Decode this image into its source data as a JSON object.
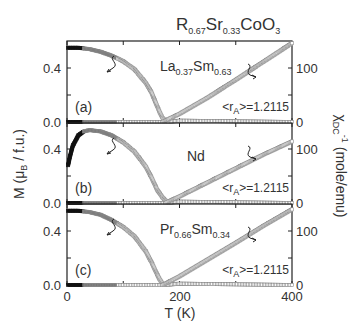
{
  "figure": {
    "title": {
      "main": "R",
      "sub1": "0.67",
      "mid": "Sr",
      "sub2": "0.33",
      "end": "CoO",
      "sub3": "3"
    },
    "x_axis": {
      "label": "T (K)",
      "ticks": [
        "0",
        "200",
        "400"
      ]
    },
    "left_axis": {
      "label": "M (μ",
      "label_sub": "B",
      "label_end": " / f.u.)",
      "ticks": [
        "0.0",
        "0.4"
      ]
    },
    "right_axis": {
      "label": "χ",
      "label_sub": "DC",
      "label_sup": "-1",
      "label_end": " (mole/emu)",
      "ticks": [
        "0",
        "100"
      ]
    },
    "panels": [
      {
        "tag": "(a)",
        "compound": {
          "a": "La",
          "a_sub": "0.37",
          "b": "Sm",
          "b_sub": "0.63"
        },
        "ra_text": "<r",
        "ra_sub": "A",
        "ra_end": ">=1.2115"
      },
      {
        "tag": "(b)",
        "compound": {
          "a": "Nd",
          "a_sub": "",
          "b": "",
          "b_sub": ""
        },
        "ra_text": "<r",
        "ra_sub": "A",
        "ra_end": ">=1.2115"
      },
      {
        "tag": "(c)",
        "compound": {
          "a": "Pr",
          "a_sub": "0.66",
          "b": "Sm",
          "b_sub": "0.34"
        },
        "ra_text": "<r",
        "ra_sub": "A",
        "ra_end": ">=1.2115"
      }
    ]
  },
  "chart_data": {
    "type": "scatter",
    "title": "R0.67Sr0.33CoO3",
    "xlabel": "T (K)",
    "ylabel": "M (μB / f.u.)",
    "ylabel_right": "χDC^-1 (mole/emu)",
    "xlim": [
      0,
      400
    ],
    "ylim": [
      0.0,
      0.6
    ],
    "ylim_right": [
      0,
      150
    ],
    "x_ticks": [
      0,
      200,
      400
    ],
    "y_ticks": [
      0.0,
      0.4
    ],
    "y_right_ticks": [
      0,
      100
    ],
    "panels": [
      {
        "label": "(a)",
        "compound": "La0.37Sm0.63",
        "annotation": "<rA>=1.2115",
        "series": [
          {
            "name": "M (left axis)",
            "x": [
              2,
              20,
              40,
              60,
              80,
              100,
              120,
              140,
              150,
              160,
              165,
              170,
              175,
              180
            ],
            "y": [
              0.55,
              0.55,
              0.54,
              0.52,
              0.49,
              0.45,
              0.39,
              0.29,
              0.22,
              0.12,
              0.07,
              0.03,
              0.01,
              0.0
            ]
          },
          {
            "name": "M baseline (left axis)",
            "x": [
              2,
              100,
              180,
              200,
              300,
              400
            ],
            "y": [
              0.0,
              0.0,
              0.0,
              0.01,
              0.005,
              0.0
            ]
          },
          {
            "name": "inverse chi (right axis)",
            "x": [
              170,
              180,
              200,
              250,
              300,
              350,
              400
            ],
            "y": [
              0,
              5,
              15,
              45,
              78,
              112,
              146
            ]
          }
        ]
      },
      {
        "label": "(b)",
        "compound": "Nd",
        "annotation": "<rA>=1.2115",
        "series": [
          {
            "name": "M (left axis)",
            "x": [
              2,
              5,
              10,
              20,
              30,
              40,
              60,
              80,
              100,
              120,
              140,
              150,
              160,
              170,
              180
            ],
            "y": [
              0.28,
              0.34,
              0.42,
              0.5,
              0.53,
              0.54,
              0.53,
              0.5,
              0.45,
              0.38,
              0.27,
              0.19,
              0.1,
              0.04,
              0.0
            ]
          },
          {
            "name": "M baseline (left axis)",
            "x": [
              2,
              100,
              180,
              200,
              300,
              400
            ],
            "y": [
              0.0,
              0.0,
              0.0,
              0.01,
              0.005,
              0.0
            ]
          },
          {
            "name": "inverse chi (right axis)",
            "x": [
              175,
              185,
              200,
              250,
              300,
              350,
              400
            ],
            "y": [
              0,
              5,
              12,
              38,
              64,
              90,
              114
            ]
          }
        ]
      },
      {
        "label": "(c)",
        "compound": "Pr0.66Sm0.34",
        "annotation": "<rA>=1.2115",
        "series": [
          {
            "name": "M (left axis)",
            "x": [
              2,
              20,
              40,
              60,
              80,
              100,
              120,
              140,
              150,
              160,
              165,
              170,
              175
            ],
            "y": [
              0.55,
              0.55,
              0.54,
              0.52,
              0.48,
              0.43,
              0.36,
              0.25,
              0.17,
              0.08,
              0.04,
              0.01,
              0.0
            ]
          },
          {
            "name": "M baseline (left axis)",
            "x": [
              2,
              100,
              175,
              200,
              300,
              400
            ],
            "y": [
              0.0,
              0.0,
              0.0,
              0.01,
              0.005,
              0.0
            ]
          },
          {
            "name": "inverse chi (right axis)",
            "x": [
              170,
              180,
              200,
              250,
              300,
              350,
              400
            ],
            "y": [
              0,
              5,
              16,
              47,
              78,
              110,
              140
            ]
          }
        ]
      }
    ]
  }
}
